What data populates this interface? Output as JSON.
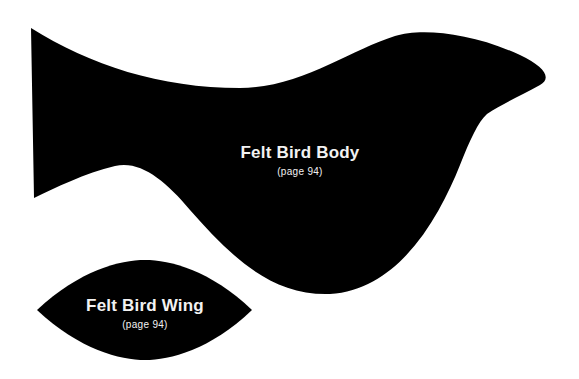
{
  "colors": {
    "background": "#ffffff",
    "shape_fill": "#000000",
    "text": "#f2f2f2"
  },
  "pieces": [
    {
      "name": "body",
      "title": "Felt Bird Body",
      "subtitle": "(page 94)"
    },
    {
      "name": "wing",
      "title": "Felt Bird Wing",
      "subtitle": "(page 94)"
    }
  ]
}
